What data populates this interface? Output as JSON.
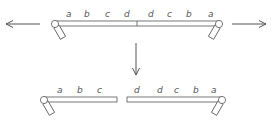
{
  "diagram": {
    "colors": {
      "stroke": "#555555",
      "background": "#ffffff"
    },
    "top_chromosome": {
      "labels": [
        "a",
        "b",
        "c",
        "d",
        "d",
        "c",
        "b",
        "a"
      ]
    },
    "bottom_left_fragment": {
      "labels": [
        "a",
        "b",
        "c"
      ]
    },
    "bottom_right_fragment": {
      "labels": [
        "d",
        "d",
        "c",
        "b",
        "a"
      ]
    },
    "arrows": {
      "left": "arrow-left",
      "right": "arrow-right",
      "down": "arrow-down"
    }
  }
}
